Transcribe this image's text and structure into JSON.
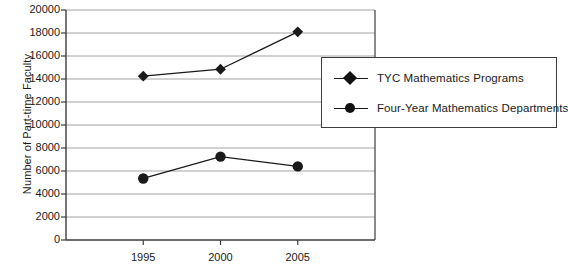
{
  "chart_data": {
    "type": "line",
    "title": "",
    "xlabel": "",
    "ylabel": "Number of Part-time Faculty",
    "categories": [
      "1995",
      "2000",
      "2005"
    ],
    "series": [
      {
        "name": "TYC Mathematics Programs",
        "marker": "diamond",
        "values": [
          14250,
          14850,
          18100
        ]
      },
      {
        "name": "Four-Year Mathematics Departments",
        "marker": "circle",
        "values": [
          5350,
          7250,
          6400
        ]
      }
    ],
    "ylim": [
      0,
      20000
    ],
    "ytick_labels": [
      "0",
      "2000",
      "4000",
      "6000",
      "8000",
      "10000",
      "12000",
      "14000",
      "16000",
      "18000",
      "20000"
    ],
    "ytick_values": [
      0,
      2000,
      4000,
      6000,
      8000,
      10000,
      12000,
      14000,
      16000,
      18000,
      20000
    ],
    "grid": "horizontal",
    "legend_position": "right-overlay",
    "line_color": "#1a1a1a",
    "grid_color": "#9a9a9a",
    "axis_color": "#3c3c3c",
    "background": "#ffffff"
  }
}
